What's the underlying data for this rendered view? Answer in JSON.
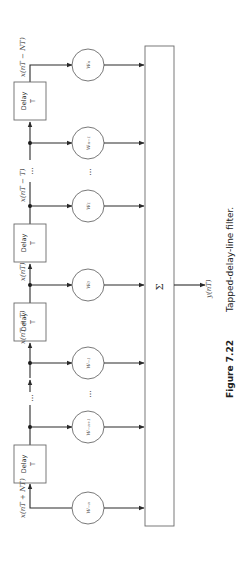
{
  "diagram": {
    "delay_block": {
      "title": "Delay",
      "sub": "T"
    },
    "signals": {
      "input": "x(nT + NT)",
      "tap_plus_T": "x(nT + T)",
      "tap_0": "x(nT)",
      "tap_minus_T": "x(nT − T)",
      "output_end": "x(nT − NT)",
      "output": "y(nT)"
    },
    "coefficients": {
      "w_minus_N": "w₋ₙ",
      "w_minus_N_plus_1": "w₋ₙ₊₁",
      "w_minus_1": "w₋₁",
      "w_0": "w₀",
      "w_1": "w₁",
      "w_N_minus_1": "wₙ₋₁",
      "w_N": "wₙ"
    },
    "summer_symbol": "Σ",
    "ellipsis": "…"
  },
  "caption": {
    "number": "Figure 7.22",
    "text": "Tapped-delay-line filter."
  }
}
